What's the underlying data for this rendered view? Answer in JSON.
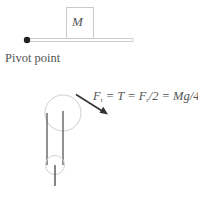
{
  "diagram": {
    "mass_label": "M",
    "pivot_label": "Pivot point",
    "equation": {
      "f_t": "F",
      "sub_t": "t",
      "eq1": " = T = ",
      "f_r": "F",
      "sub_r": "r",
      "tail": "/2 = Mg/4"
    },
    "colors": {
      "stroke_light": "#c8c8c8",
      "stroke_dark": "#444444",
      "pivot_dot": "#222222",
      "text": "#555555"
    }
  }
}
